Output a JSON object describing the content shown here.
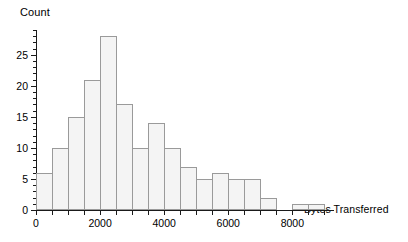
{
  "chart_data": {
    "type": "bar",
    "title": "",
    "xlabel": "Bytes Transferred",
    "ylabel": "Count",
    "xlim": [
      0,
      9300
    ],
    "ylim": [
      0,
      29
    ],
    "bin_width": 500,
    "grid": false,
    "legend": null,
    "x_ticks": [
      0,
      2000,
      4000,
      6000,
      8000
    ],
    "x_tick_labels": [
      "0",
      "2000",
      "4000",
      "6000",
      "8000"
    ],
    "x_minor_tick_step": 500,
    "y_ticks": [
      0,
      5,
      10,
      15,
      20,
      25
    ],
    "y_tick_labels": [
      "0",
      "5",
      "10",
      "15",
      "20",
      "25"
    ],
    "y_minor_tick_step": 1,
    "bin_edges": [
      0,
      500,
      1000,
      1500,
      2000,
      2500,
      3000,
      3500,
      4000,
      4500,
      5000,
      5500,
      6000,
      6500,
      7000,
      7500,
      8000,
      8500,
      9000
    ],
    "categories": [
      "0-500",
      "500-1000",
      "1000-1500",
      "1500-2000",
      "2000-2500",
      "2500-3000",
      "3000-3500",
      "3500-4000",
      "4000-4500",
      "4500-5000",
      "5000-5500",
      "5500-6000",
      "6000-6500",
      "6500-7000",
      "7000-7500",
      "7500-8000",
      "8000-8500",
      "8500-9000"
    ],
    "values": [
      6,
      10,
      15,
      21,
      28,
      17,
      10,
      14,
      10,
      7,
      5,
      6,
      5,
      5,
      2,
      0,
      1,
      1
    ],
    "bar_fill_color": "#f4f4f4",
    "bar_edge_color": "#9a9a9a",
    "axis_color": "#1a1a1a",
    "background_color": "#ffffff"
  }
}
